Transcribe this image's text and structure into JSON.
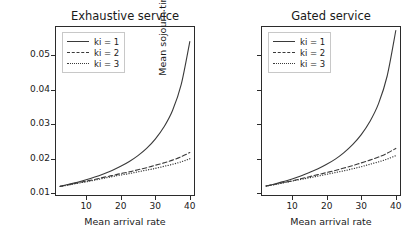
{
  "figure": {
    "background": "#ffffff",
    "line_color": "#3a3a3a",
    "axis_color": "#2b2b2b"
  },
  "panels": [
    {
      "key": "exhaustive",
      "title": "Exhaustive service",
      "xlabel": "Mean arrival rate",
      "ylabel": "Mean sojourn time, s",
      "show_ytick_labels": true,
      "xticks": [
        "10",
        "20",
        "30",
        "40"
      ],
      "yticks": [
        "0.01",
        "0.02",
        "0.03",
        "0.04",
        "0.05"
      ],
      "legend": [
        {
          "label": "ki = 1",
          "style": "solid"
        },
        {
          "label": "ki = 2",
          "style": "dashed"
        },
        {
          "label": "ki = 3",
          "style": "dotted"
        }
      ]
    },
    {
      "key": "gated",
      "title": "Gated service",
      "xlabel": "Mean arrival rate",
      "ylabel": "Mean sojourn time, s",
      "show_ytick_labels": false,
      "xticks": [
        "10",
        "20",
        "30",
        "40"
      ],
      "yticks": [
        "0.01",
        "0.02",
        "0.03",
        "0.04",
        "0.05"
      ],
      "legend": [
        {
          "label": "ki = 1",
          "style": "solid"
        },
        {
          "label": "ki = 2",
          "style": "dashed"
        },
        {
          "label": "ki = 3",
          "style": "dotted"
        }
      ]
    }
  ],
  "chart_data": [
    {
      "type": "line",
      "title": "Exhaustive service",
      "xlabel": "Mean arrival rate",
      "ylabel": "Mean sojourn time, s",
      "xlim": [
        1.0,
        41.5
      ],
      "ylim": [
        0.0092,
        0.0585
      ],
      "xticks": [
        10,
        20,
        30,
        40
      ],
      "yticks": [
        0.01,
        0.02,
        0.03,
        0.04,
        0.05
      ],
      "grid": false,
      "legend_position": "upper left",
      "x": [
        2.5,
        5,
        7.5,
        10,
        12.5,
        15,
        17.5,
        20,
        22.5,
        25,
        27.5,
        30,
        32.5,
        35,
        37.5,
        40
      ],
      "series": [
        {
          "name": "ki = 1",
          "style": "solid",
          "values": [
            0.012,
            0.0126,
            0.0132,
            0.0139,
            0.0147,
            0.0156,
            0.0166,
            0.0178,
            0.0192,
            0.0209,
            0.023,
            0.0257,
            0.0292,
            0.034,
            0.0415,
            0.054
          ]
        },
        {
          "name": "ki = 2",
          "style": "dashed",
          "values": [
            0.012,
            0.0125,
            0.013,
            0.0135,
            0.014,
            0.0146,
            0.0151,
            0.0157,
            0.0162,
            0.0168,
            0.0174,
            0.0181,
            0.0188,
            0.0196,
            0.0206,
            0.0218
          ]
        },
        {
          "name": "ki = 3",
          "style": "dotted",
          "values": [
            0.012,
            0.0124,
            0.0129,
            0.0133,
            0.0138,
            0.0143,
            0.0148,
            0.0153,
            0.0157,
            0.0162,
            0.0167,
            0.0172,
            0.0178,
            0.0184,
            0.0191,
            0.02
          ]
        }
      ]
    },
    {
      "type": "line",
      "title": "Gated service",
      "xlabel": "Mean arrival rate",
      "ylabel": "Mean sojourn time, s",
      "xlim": [
        1.0,
        41.5
      ],
      "ylim": [
        0.0092,
        0.0585
      ],
      "xticks": [
        10,
        20,
        30,
        40
      ],
      "yticks": [
        0.01,
        0.02,
        0.03,
        0.04,
        0.05
      ],
      "grid": false,
      "legend_position": "upper left",
      "x": [
        2.5,
        5,
        7.5,
        10,
        12.5,
        15,
        17.5,
        20,
        22.5,
        25,
        27.5,
        30,
        32.5,
        35,
        37.5,
        40
      ],
      "series": [
        {
          "name": "ki = 1",
          "style": "solid",
          "values": [
            0.0121,
            0.0127,
            0.0134,
            0.0141,
            0.015,
            0.016,
            0.0171,
            0.0184,
            0.0199,
            0.0218,
            0.0241,
            0.027,
            0.0308,
            0.036,
            0.044,
            0.0572
          ]
        },
        {
          "name": "ki = 2",
          "style": "dashed",
          "values": [
            0.0121,
            0.0126,
            0.0131,
            0.0136,
            0.0142,
            0.0148,
            0.0154,
            0.016,
            0.0166,
            0.0173,
            0.018,
            0.0188,
            0.0196,
            0.0205,
            0.0216,
            0.023
          ]
        },
        {
          "name": "ki = 3",
          "style": "dotted",
          "values": [
            0.0121,
            0.0125,
            0.013,
            0.0135,
            0.014,
            0.0145,
            0.015,
            0.0155,
            0.016,
            0.0165,
            0.0171,
            0.0177,
            0.0184,
            0.0191,
            0.0199,
            0.0209
          ]
        }
      ]
    }
  ]
}
